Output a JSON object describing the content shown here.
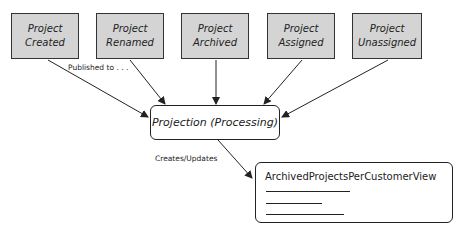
{
  "events": [
    {
      "line1": "Project",
      "line2": "Created"
    },
    {
      "line1": "Project",
      "line2": "Renamed"
    },
    {
      "line1": "Project",
      "line2": "Archived"
    },
    {
      "line1": "Project",
      "line2": "Assigned"
    },
    {
      "line1": "Project",
      "line2": "Unassigned"
    }
  ],
  "labels": {
    "published": "Published to . . .",
    "creates": "Creates/Updates"
  },
  "projection": {
    "title": "Projection (Processing)"
  },
  "view": {
    "title": "ArchivedProjectsPerCustomerView"
  },
  "colors": {
    "event_fill": "#d4d4d4",
    "stroke": "#222222"
  }
}
